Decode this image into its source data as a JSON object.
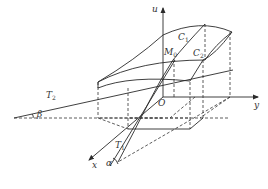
{
  "diagram": {
    "axes": {
      "u": "u",
      "y": "y",
      "x": "x",
      "origin": "O"
    },
    "curves": {
      "c1": {
        "main": "C",
        "sub": "1"
      },
      "c2": {
        "main": "C",
        "sub": "2"
      }
    },
    "point": {
      "main": "M",
      "sub": "0"
    },
    "tangents": {
      "t1": {
        "main": "T",
        "sub": "1"
      },
      "t2": {
        "main": "T",
        "sub": "2"
      }
    },
    "angles": {
      "alpha": "α",
      "beta": "β"
    },
    "colors": {
      "line": "#2a2a2a",
      "background": "#ffffff"
    }
  }
}
